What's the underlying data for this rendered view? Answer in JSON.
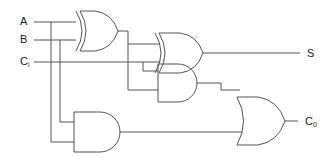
{
  "diagram": {
    "inputs": [
      {
        "label": "A",
        "sub": ""
      },
      {
        "label": "B",
        "sub": ""
      },
      {
        "label": "C",
        "sub": "i"
      }
    ],
    "outputs": [
      {
        "label": "S",
        "sub": ""
      },
      {
        "label": "C",
        "sub": "0"
      }
    ],
    "gates": [
      {
        "id": "xor1",
        "type": "XOR",
        "inputs": [
          "A",
          "B"
        ]
      },
      {
        "id": "xor2",
        "type": "XOR",
        "inputs": [
          "xor1",
          "Ci"
        ],
        "output": "S"
      },
      {
        "id": "and1",
        "type": "AND",
        "inputs": [
          "Ci",
          "xor1"
        ]
      },
      {
        "id": "and2",
        "type": "AND",
        "inputs": [
          "B",
          "A"
        ]
      },
      {
        "id": "or1",
        "type": "OR",
        "inputs": [
          "and1",
          "and2"
        ],
        "output": "C0"
      }
    ],
    "colors": {
      "line": "#555555",
      "text": "#222222",
      "background": "#ffffff"
    }
  }
}
